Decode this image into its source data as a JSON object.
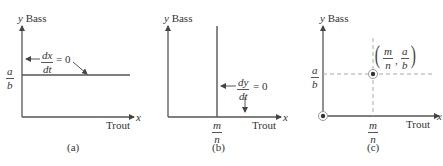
{
  "panels": [
    {
      "id": "a",
      "caption": "(a)",
      "y_axis_label_var": "y",
      "y_axis_label": "Bass",
      "x_axis_label_var": "x",
      "x_axis_label": "Trout",
      "tick_y": {
        "num": "a",
        "den": "b"
      },
      "nullcline": {
        "num": "dx",
        "den": "dt",
        "rhs": "= 0",
        "orientation": "horizontal"
      }
    },
    {
      "id": "b",
      "caption": "(b)",
      "y_axis_label_var": "y",
      "y_axis_label": "Bass",
      "x_axis_label_var": "x",
      "x_axis_label": "Trout",
      "tick_x": {
        "num": "m",
        "den": "n"
      },
      "nullcline": {
        "num": "dy",
        "den": "dt",
        "rhs": "= 0",
        "orientation": "vertical"
      }
    },
    {
      "id": "c",
      "caption": "(c)",
      "y_axis_label_var": "y",
      "y_axis_label": "Bass",
      "x_axis_label_var": "x",
      "x_axis_label": "Trout",
      "tick_y": {
        "num": "a",
        "den": "b"
      },
      "tick_x": {
        "num": "m",
        "den": "n"
      },
      "equilibrium_point": {
        "x": {
          "num": "m",
          "den": "n"
        },
        "y": {
          "num": "a",
          "den": "b"
        },
        "separator": ","
      },
      "points": [
        "origin",
        "(m/n, a/b)"
      ]
    }
  ],
  "colors": {
    "axis": "#555555",
    "dashed": "#aaaaaa",
    "point": "#333333"
  }
}
